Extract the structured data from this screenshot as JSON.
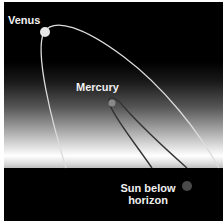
{
  "diagram": {
    "labels": {
      "venus": "Venus",
      "mercury": "Mercury",
      "sun_line1": "Sun below",
      "sun_line2": "horizon"
    },
    "colors": {
      "sky_top": "#000000",
      "horizon_glow": "#ffffff",
      "ground": "#000000",
      "venus_orbit": "#e0e0e0",
      "mercury_orbit": "#2a2a2a",
      "sun": "#555555"
    }
  }
}
